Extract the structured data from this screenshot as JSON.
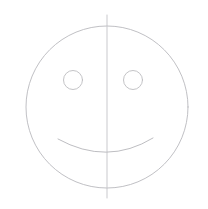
{
  "canvas": {
    "width": 208,
    "height": 209,
    "background_color": "#ffffff",
    "title": "Smiley Face Line Drawing"
  },
  "style": {
    "stroke_color": "#b9b9bd",
    "stroke_color_light": "#c9c9cd",
    "stroke_width": 0.9,
    "fill": "none"
  },
  "shapes": {
    "face": {
      "label": "Face Outline",
      "type": "circle",
      "cx": 107,
      "cy": 107,
      "r": 81,
      "stroke_color": "#b9b9bd",
      "stroke_width": 0.9
    },
    "left_eye": {
      "label": "Left Eye",
      "type": "circle",
      "cx": 73,
      "cy": 80,
      "r": 9.5,
      "stroke_color": "#bcbcc0",
      "stroke_width": 0.9
    },
    "right_eye": {
      "label": "Right Eye",
      "type": "circle",
      "cx": 133,
      "cy": 80,
      "r": 9.5,
      "stroke_color": "#bcbcc0",
      "stroke_width": 0.9
    },
    "mouth": {
      "label": "Smile",
      "type": "arc",
      "path": "M 58 139 Q 107 166 153 138",
      "start_x": 58,
      "start_y": 139,
      "end_x": 153,
      "end_y": 138,
      "control_x": 107,
      "control_y": 166,
      "stroke_color": "#b6b6ba",
      "stroke_width": 0.9
    },
    "center_line": {
      "label": "Vertical Symmetry Line",
      "type": "line",
      "x1": 107,
      "y1": 15,
      "x2": 107,
      "y2": 198,
      "stroke_color": "#c3c3c7",
      "stroke_width": 0.9
    }
  }
}
